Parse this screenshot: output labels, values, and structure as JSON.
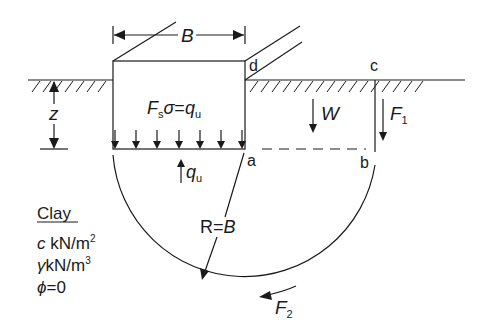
{
  "diagram": {
    "width_label": "B",
    "depth_label": "z",
    "equation": {
      "lhs_F": "F",
      "lhs_sub": "s",
      "sigma": "σ",
      "eq": "=",
      "rhs_q": "q",
      "rhs_sub": "u"
    },
    "reaction": {
      "q": "q",
      "sub": "u"
    },
    "points": {
      "a": "a",
      "b": "b",
      "c": "c",
      "d": "d"
    },
    "weight_label": "W",
    "force1": {
      "F": "F",
      "sub": "1"
    },
    "force2": {
      "F": "F",
      "sub": "2"
    },
    "radius_label": {
      "R": "R",
      "eq": "=",
      "B": "B"
    },
    "soil": {
      "title": "Clay",
      "line1_sym": "c",
      "line1_unit": " kN/m",
      "line1_exp": "2",
      "line2_sym": "γ",
      "line2_unit": "kN/m",
      "line2_exp": "3",
      "line3_sym": "ϕ",
      "line3_rest": "=0"
    },
    "colors": {
      "ink": "#1a1a1a",
      "background": "#ffffff"
    }
  }
}
